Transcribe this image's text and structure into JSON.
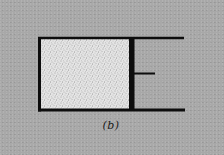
{
  "figure": {
    "label": "(b)"
  },
  "colors": {
    "background": "#a8a8a8",
    "ink": "#0d0d0d",
    "gas_fill": "#e6e6e6",
    "gas_dots": "#555555"
  },
  "geometry": {
    "chamber": {
      "x": 40,
      "y": 38,
      "width": 91,
      "height": 71
    },
    "top_wall": {
      "x1": 38,
      "y1": 38,
      "x2": 184,
      "y2": 38
    },
    "bottom_wall": {
      "x1": 38,
      "y1": 110,
      "x2": 185,
      "y2": 110
    },
    "left_wall": {
      "x1": 39.5,
      "y1": 37,
      "x2": 39.5,
      "y2": 111.5
    },
    "piston": {
      "x": 129,
      "y": 37,
      "width": 5.5,
      "height": 74
    },
    "piston_rod": {
      "x1": 134,
      "y1": 73.5,
      "x2": 155,
      "y2": 73.5
    }
  }
}
